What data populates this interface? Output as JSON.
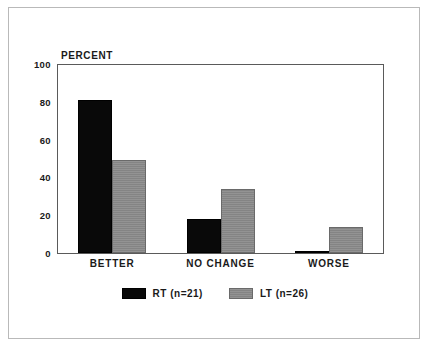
{
  "chart_data": {
    "type": "bar",
    "title": "",
    "subtitle": "",
    "ylabel": "PERCENT",
    "xlabel": "",
    "categories": [
      "BETTER",
      "NO CHANGE",
      "WORSE"
    ],
    "series": [
      {
        "name": "RT (n=21)",
        "short_name": "RT",
        "n": 21,
        "color": "#090909",
        "values": [
          81,
          18,
          1
        ]
      },
      {
        "name": "LT (n=26)",
        "short_name": "LT",
        "n": 26,
        "color": "#8b8b8b",
        "values": [
          49,
          34,
          14
        ]
      }
    ],
    "ylim": [
      0,
      100
    ],
    "yticks": [
      0,
      20,
      40,
      60,
      80,
      100
    ],
    "ytick_labels": [
      "0",
      "20",
      "40",
      "60",
      "80",
      "100"
    ],
    "grid": false,
    "legend_position": "bottom-center",
    "frame": true,
    "annotations": []
  },
  "axis": {
    "y_title": "PERCENT",
    "ticks": [
      {
        "value": 100,
        "label": "100"
      },
      {
        "value": 80,
        "label": "80"
      },
      {
        "value": 60,
        "label": "60"
      },
      {
        "value": 40,
        "label": "40"
      },
      {
        "value": 20,
        "label": "20"
      },
      {
        "value": 0,
        "label": "0"
      }
    ]
  },
  "categories": [
    {
      "label": "BETTER"
    },
    {
      "label": "NO CHANGE"
    },
    {
      "label": "WORSE"
    }
  ],
  "legend": {
    "items": [
      {
        "label": "RT (n=21)",
        "swatch": "rt"
      },
      {
        "label": "LT (n=26)",
        "swatch": "lt"
      }
    ]
  },
  "colors": {
    "rt_bar": "#090909",
    "lt_bar": "#8b8b8b",
    "frame": "#5a5a5a",
    "outer_frame": "#b9b9b9",
    "text": "#1a1a1a",
    "background": "#ffffff"
  }
}
